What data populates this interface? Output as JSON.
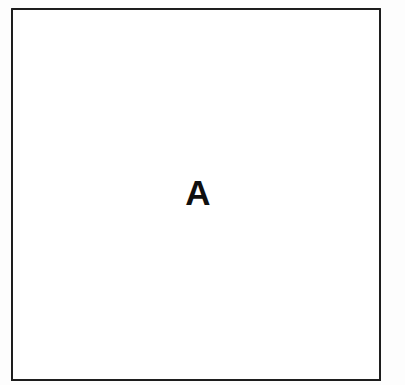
{
  "figure": {
    "panel": {
      "label": "A",
      "label_color": "#101010",
      "fill_color": "#ffffff",
      "border_color": "#1c1c1c"
    },
    "background_color": "#fdfdfd"
  }
}
